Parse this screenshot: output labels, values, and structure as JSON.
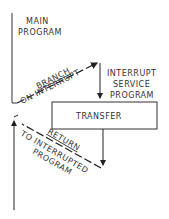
{
  "diagram": {
    "main_program": {
      "line1": "MAIN",
      "line2": "PROGRAM"
    },
    "branch": {
      "line1": "BRANCH",
      "line2": "ON INTERRUPT"
    },
    "service": {
      "line1": "INTERRUPT",
      "line2": "SERVICE",
      "line3": "PROGRAM"
    },
    "transfer": "TRANSFER",
    "return": {
      "line1": "RETURN",
      "line2": "TO INTERRUPTED",
      "line3": "PROGRAM"
    },
    "colors": {
      "ink": "#222222",
      "background": "#ffffff"
    }
  }
}
